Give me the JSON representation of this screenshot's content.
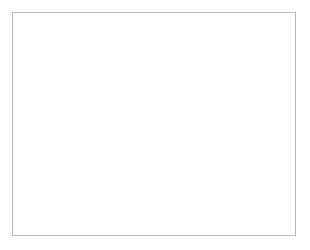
{
  "chart_data": {
    "type": "scatter",
    "title": "",
    "xlabel": "Total T3 (nmol/l)",
    "xlabel_main": "Total T",
    "xlabel_sub": "3",
    "xlabel_unit": " (nmol/l)",
    "ylabel": "E2 (pmol/l)",
    "ylabel_main": "E",
    "ylabel_sub": "2",
    "ylabel_unit": " (pmol/l)",
    "xlim": [
      0.5,
      4.0
    ],
    "ylim": [
      0,
      180
    ],
    "xticks": [
      0.5,
      1.0,
      1.5,
      2.0,
      2.5,
      3.0,
      3.5,
      4.0
    ],
    "xtick_labels": [
      "0.5",
      "1.0",
      "1.5",
      "2.0",
      "2.5",
      "3.0",
      "3.5",
      "4.0"
    ],
    "yticks": [
      0,
      20,
      40,
      60,
      80,
      100,
      120,
      140,
      160,
      180
    ],
    "ytick_labels": [
      "0",
      "20",
      "40",
      "60",
      "80",
      "100",
      "120",
      "140",
      "160",
      "180"
    ],
    "grid": false,
    "legend": "none",
    "marker_shape": "square",
    "marker_color": "#111111",
    "line_color": "#5a5a5a",
    "annotations": [
      "r = 0.94; p < 0.001",
      "y = 54.7 × −40.4"
    ],
    "regression": {
      "slope": 54.7,
      "intercept": -40.4,
      "r": 0.94,
      "p_text": "p < 0.001",
      "x_start": 0.7,
      "x_end": 3.45
    },
    "x": [
      1.1,
      1.22,
      1.53,
      1.63,
      1.65,
      1.7,
      1.82,
      1.84,
      1.86,
      1.88,
      1.88,
      1.9,
      1.92,
      1.97,
      1.99,
      2.01,
      2.05,
      2.08,
      2.12,
      2.15,
      2.17,
      2.18,
      2.2,
      2.22,
      2.25,
      2.3,
      2.35,
      2.38,
      2.42,
      2.5,
      2.52,
      2.72,
      2.75,
      2.78,
      2.8,
      2.82,
      2.85,
      3.0,
      3.05,
      3.08,
      3.18,
      3.2,
      3.22,
      3.3,
      3.33
    ],
    "y": [
      29,
      26,
      41,
      47,
      59,
      65,
      55,
      54,
      57,
      56,
      62,
      58,
      66,
      76,
      68,
      91,
      64,
      58,
      80,
      82,
      78,
      81,
      80,
      75,
      82,
      78,
      79,
      80,
      82,
      117,
      58,
      132,
      131,
      113,
      120,
      131,
      112,
      130,
      101,
      131,
      144,
      155,
      152,
      149,
      151
    ],
    "n_points": 45
  }
}
